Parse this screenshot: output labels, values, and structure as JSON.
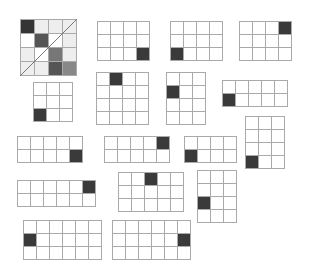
{
  "figure": {
    "line_color": "#aaaaaa",
    "dark_color": "#3a3a3a",
    "grids": [
      {
        "id": "g1",
        "x": 20,
        "y": 19,
        "cols": 4,
        "rows": 4,
        "cell": 14,
        "diagonal": true,
        "shades": [
          [
            "#353535",
            "#eeeeee",
            "#eeeeee",
            "#eeeeee"
          ],
          [
            "#ffffff",
            "#555555",
            "#ffffff",
            "#eeeeee"
          ],
          [
            "#eeeeee",
            "#ffffff",
            "#777777",
            "#eeeeee"
          ],
          [
            "#eeeeee",
            "#eeeeee",
            "#555555",
            "#888888"
          ]
        ]
      },
      {
        "id": "g2",
        "x": 97,
        "y": 21,
        "cols": 4,
        "rows": 3,
        "cell": 13,
        "dark": [
          [
            2,
            3
          ]
        ]
      },
      {
        "id": "g3",
        "x": 170,
        "y": 21,
        "cols": 4,
        "rows": 3,
        "cell": 13,
        "dark": [
          [
            2,
            0
          ]
        ]
      },
      {
        "id": "g4",
        "x": 239,
        "y": 21,
        "cols": 4,
        "rows": 3,
        "cell": 13,
        "dark": [
          [
            0,
            3
          ]
        ]
      },
      {
        "id": "g5",
        "x": 33,
        "y": 82,
        "cols": 3,
        "rows": 3,
        "cell": 13,
        "dark": [
          [
            2,
            0
          ]
        ]
      },
      {
        "id": "g6",
        "x": 96,
        "y": 72,
        "cols": 4,
        "rows": 4,
        "cell": 13,
        "dark": [
          [
            0,
            1
          ]
        ]
      },
      {
        "id": "g7",
        "x": 166,
        "y": 72,
        "cols": 3,
        "rows": 4,
        "cell": 13,
        "dark": [
          [
            1,
            0
          ]
        ]
      },
      {
        "id": "g8",
        "x": 222,
        "y": 80,
        "cols": 5,
        "rows": 2,
        "cell": 13,
        "dark": [
          [
            1,
            0
          ]
        ]
      },
      {
        "id": "g9",
        "x": 17,
        "y": 136,
        "cols": 5,
        "rows": 2,
        "cell": 13,
        "dark": [
          [
            1,
            4
          ]
        ]
      },
      {
        "id": "g10",
        "x": 104,
        "y": 136,
        "cols": 5,
        "rows": 2,
        "cell": 13,
        "dark": [
          [
            0,
            4
          ]
        ]
      },
      {
        "id": "g11",
        "x": 184,
        "y": 136,
        "cols": 4,
        "rows": 2,
        "cell": 13,
        "dark": [
          [
            1,
            0
          ]
        ]
      },
      {
        "id": "g12",
        "x": 245,
        "y": 116,
        "cols": 3,
        "rows": 4,
        "cell": 13,
        "dark": [
          [
            3,
            0
          ]
        ]
      },
      {
        "id": "g13",
        "x": 17,
        "y": 180,
        "cols": 6,
        "rows": 2,
        "cell": 13,
        "dark": [
          [
            0,
            5
          ]
        ]
      },
      {
        "id": "g14",
        "x": 118,
        "y": 172,
        "cols": 5,
        "rows": 3,
        "cell": 13,
        "dark": [
          [
            0,
            2
          ]
        ]
      },
      {
        "id": "g15",
        "x": 197,
        "y": 170,
        "cols": 3,
        "rows": 4,
        "cell": 13,
        "dark": [
          [
            2,
            0
          ]
        ]
      },
      {
        "id": "g16",
        "x": 23,
        "y": 220,
        "cols": 6,
        "rows": 3,
        "cell": 13,
        "dark": [
          [
            1,
            0
          ]
        ]
      },
      {
        "id": "g17",
        "x": 112,
        "y": 220,
        "cols": 6,
        "rows": 3,
        "cell": 13,
        "dark": [
          [
            1,
            5
          ]
        ]
      }
    ]
  }
}
